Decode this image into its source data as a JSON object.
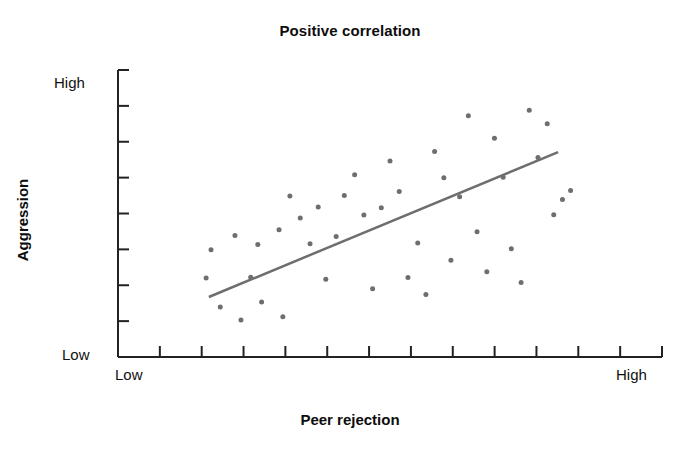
{
  "chart_data": {
    "type": "scatter",
    "title": "Positive correlation",
    "xlabel": "Peer rejection",
    "ylabel": "Aggression",
    "xlim": [
      0,
      100
    ],
    "ylim": [
      0,
      100
    ],
    "grid": false,
    "legend": null,
    "x_tick_labels": {
      "left": "Low",
      "right": "High"
    },
    "y_tick_labels": {
      "bottom": "Low",
      "top": "High"
    },
    "x_tick_count": 12,
    "y_tick_count": 8,
    "marker": {
      "color": "#6e6e6e",
      "size_px": 5,
      "shape": "circle"
    },
    "trendline": {
      "color": "#6e6e6e",
      "width_px": 2.5,
      "x_start": 16.7,
      "y_start": 20.9,
      "x_end": 80.9,
      "y_end": 71.4,
      "description": "positive linear trend line"
    },
    "points": [
      {
        "x": 16.2,
        "y": 27.5
      },
      {
        "x": 17.1,
        "y": 37.4
      },
      {
        "x": 18.8,
        "y": 17.4
      },
      {
        "x": 21.5,
        "y": 42.3
      },
      {
        "x": 22.6,
        "y": 12.9
      },
      {
        "x": 24.4,
        "y": 27.8
      },
      {
        "x": 25.7,
        "y": 39.2
      },
      {
        "x": 26.4,
        "y": 19.2
      },
      {
        "x": 29.6,
        "y": 44.3
      },
      {
        "x": 30.3,
        "y": 14.0
      },
      {
        "x": 31.6,
        "y": 56.1
      },
      {
        "x": 33.5,
        "y": 48.4
      },
      {
        "x": 35.3,
        "y": 39.5
      },
      {
        "x": 36.8,
        "y": 52.3
      },
      {
        "x": 38.2,
        "y": 27.1
      },
      {
        "x": 40.1,
        "y": 42.0
      },
      {
        "x": 41.6,
        "y": 56.3
      },
      {
        "x": 43.5,
        "y": 63.5
      },
      {
        "x": 45.2,
        "y": 49.5
      },
      {
        "x": 46.8,
        "y": 23.8
      },
      {
        "x": 48.4,
        "y": 52.0
      },
      {
        "x": 50.0,
        "y": 68.3
      },
      {
        "x": 51.7,
        "y": 57.7
      },
      {
        "x": 53.3,
        "y": 27.7
      },
      {
        "x": 55.1,
        "y": 39.7
      },
      {
        "x": 56.6,
        "y": 21.8
      },
      {
        "x": 58.2,
        "y": 71.6
      },
      {
        "x": 59.9,
        "y": 62.5
      },
      {
        "x": 61.2,
        "y": 33.7
      },
      {
        "x": 62.8,
        "y": 55.8
      },
      {
        "x": 64.4,
        "y": 84.1
      },
      {
        "x": 66.0,
        "y": 43.6
      },
      {
        "x": 67.8,
        "y": 29.7
      },
      {
        "x": 69.2,
        "y": 76.2
      },
      {
        "x": 70.8,
        "y": 62.6
      },
      {
        "x": 72.3,
        "y": 37.7
      },
      {
        "x": 74.1,
        "y": 26.0
      },
      {
        "x": 75.6,
        "y": 86.0
      },
      {
        "x": 77.2,
        "y": 69.5
      },
      {
        "x": 78.9,
        "y": 81.3
      },
      {
        "x": 80.1,
        "y": 49.6
      },
      {
        "x": 81.7,
        "y": 54.9
      },
      {
        "x": 83.2,
        "y": 58.0
      }
    ]
  },
  "figure": {
    "background": "#ffffff",
    "axis_color": "#222222"
  }
}
